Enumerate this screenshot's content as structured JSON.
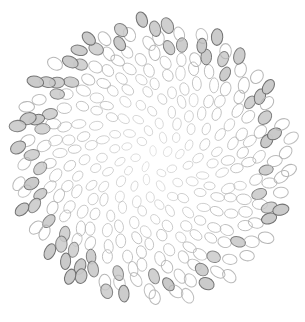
{
  "canvas": {
    "width": 305,
    "height": 322,
    "background": "#ffffff",
    "title": "Phyllotaxis Ellipse Field"
  },
  "chart_data": {
    "type": "scatter",
    "title": "",
    "subtitle": "",
    "xlabel": "",
    "ylabel": "",
    "grid": false,
    "legend": "none",
    "xlim": [
      0,
      305
    ],
    "ylim": [
      0,
      322
    ],
    "marker": "ellipse",
    "center": [
      152,
      161
    ],
    "disc_radius": 141,
    "golden_angle_deg": 137.507764,
    "point_count": 318,
    "radius_scale": 8.1,
    "ellipse_rx_range": [
      3.2,
      5.6
    ],
    "ellipse_ry_range": [
      4.6,
      8.0
    ],
    "stroke_color_inner": "#b4b4b4",
    "stroke_color_outer": "#6e6e6e",
    "fill_color_outer": "#c9c9c9",
    "fill_color_inner": "none",
    "stroke_width_range": [
      0.55,
      1.05
    ],
    "fill_threshold_radius": 112,
    "opacity_range": [
      0.45,
      0.95
    ]
  },
  "a11y": {
    "figure_role": "img",
    "alt_text": "Circular phyllotaxis pattern composed of hundreds of small gray-outlined ellipses"
  }
}
